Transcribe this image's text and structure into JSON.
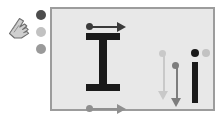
{
  "figure": {
    "background_color": "#ffffff",
    "panel": {
      "background_color": "#e8e8e8",
      "border_color": "#9c9c9c"
    }
  },
  "legend": {
    "cursor": {
      "icon": "hand-pointer-icon",
      "color": "#b4b4b4",
      "outline_color": "#6e6e6e"
    },
    "dots": [
      {
        "name": "state-dark",
        "color": "#4d4d4d",
        "shade": "dark"
      },
      {
        "name": "state-light",
        "color": "#c2c2c2",
        "shade": "light"
      },
      {
        "name": "state-mid",
        "color": "#9a9a9a",
        "shade": "medium"
      }
    ]
  },
  "diagram": {
    "i_beam": {
      "name": "i-beam-shape",
      "color": "#1a1a1a",
      "flange_top": {
        "name": "top-flange"
      },
      "flange_bottom": {
        "name": "bottom-flange"
      },
      "web": {
        "name": "web"
      }
    },
    "i_glyph": {
      "name": "i-glyph-shape",
      "stem_color": "#1a1a1a",
      "dot_color": "#1a1a1a",
      "ghost_dot_color": "#c2c2c2"
    },
    "arrows": [
      {
        "name": "top-width-arrow",
        "direction": "right",
        "color": "#3a3a3a",
        "marker": "dot-start"
      },
      {
        "name": "bottom-width-arrow",
        "direction": "right",
        "color": "#8f8f8f",
        "marker": "dot-start"
      },
      {
        "name": "beam-height-arrow",
        "direction": "down",
        "color": "#c9c9c9",
        "marker": "dot-start"
      },
      {
        "name": "i-glyph-height-arrow",
        "direction": "down",
        "color": "#7d7d7d",
        "marker": "dot-start"
      }
    ]
  }
}
